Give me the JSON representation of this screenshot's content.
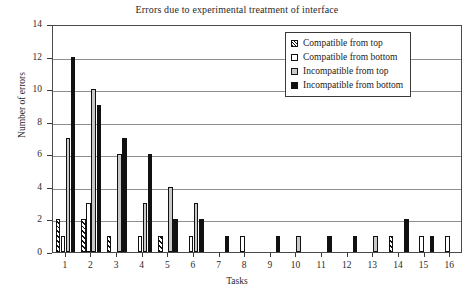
{
  "chart_data": {
    "type": "bar",
    "title": "Errors due to experimental treatment of interface",
    "xlabel": "Tasks",
    "ylabel": "Number of errors",
    "categories": [
      "1",
      "2",
      "3",
      "4",
      "5",
      "6",
      "7",
      "8",
      "9",
      "10",
      "11",
      "12",
      "13",
      "14",
      "15",
      "16"
    ],
    "ylim": [
      0,
      14
    ],
    "yticks": [
      0,
      2,
      4,
      6,
      8,
      10,
      12,
      14
    ],
    "grid": true,
    "legend_position": "top-right",
    "series": [
      {
        "name": "Compatible from top",
        "swatch": "hatched",
        "color": "#ffffff",
        "values": [
          2,
          2,
          1,
          0,
          1,
          0,
          0,
          0,
          0,
          0,
          0,
          0,
          0,
          1,
          0,
          0
        ]
      },
      {
        "name": "Compatible from bottom",
        "swatch": "empty",
        "color": "#ffffff",
        "values": [
          1,
          3,
          0,
          1,
          0,
          1,
          0,
          1,
          0,
          0,
          0,
          0,
          0,
          0,
          1,
          1
        ]
      },
      {
        "name": "Incompatible from top",
        "swatch": "gray",
        "color": "#c9c9c9",
        "values": [
          7,
          10,
          6,
          3,
          4,
          3,
          0,
          0,
          0,
          1,
          0,
          0,
          1,
          0,
          0,
          0
        ]
      },
      {
        "name": "Incompatible from bottom",
        "swatch": "solid",
        "color": "#111111",
        "values": [
          12,
          9,
          7,
          6,
          2,
          2,
          1,
          0,
          1,
          0,
          1,
          1,
          0,
          2,
          1,
          0
        ]
      }
    ]
  },
  "legend": {
    "items": [
      {
        "label": "Compatible from top"
      },
      {
        "label": "Compatible from bottom"
      },
      {
        "label": "Incompatible from top"
      },
      {
        "label": "Incompatible from bottom"
      }
    ]
  }
}
